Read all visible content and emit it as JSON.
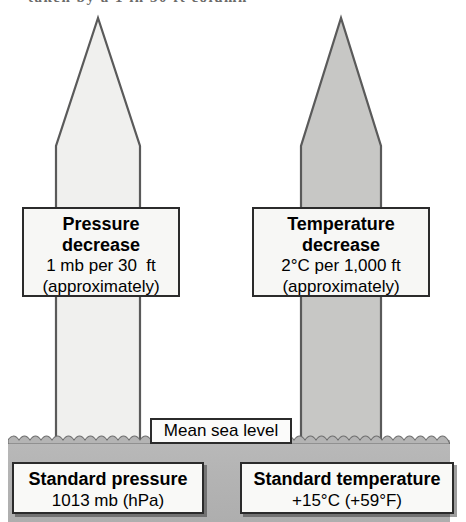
{
  "figure": {
    "top_caption_fragment": "taken by a 1 in 30 ft column",
    "background_color": "#ffffff",
    "ground_color": "#b4b4b4"
  },
  "columns": [
    {
      "name": "pressure-column",
      "fill": "#f0f0ee",
      "stroke": "#5a5a5a",
      "direction": "up"
    },
    {
      "name": "temperature-column",
      "fill": "#c7c7c5",
      "stroke": "#5a5a5a",
      "direction": "up"
    }
  ],
  "mid_labels": {
    "pressure": {
      "title_line1": "Pressure",
      "title_line2": "decrease",
      "value": "1 mb per 30  ft",
      "note": "(approximately)"
    },
    "temperature": {
      "title_line1": "Temperature",
      "title_line2": "decrease",
      "value": "2°C per 1,000 ft",
      "note": "(approximately)"
    }
  },
  "sea_level": {
    "label": "Mean sea level"
  },
  "bottom_labels": {
    "pressure": {
      "title": "Standard pressure",
      "value": "1013 mb (hPa)"
    },
    "temperature": {
      "title": "Standard temperature",
      "value": "+15°C (+59°F)"
    }
  }
}
